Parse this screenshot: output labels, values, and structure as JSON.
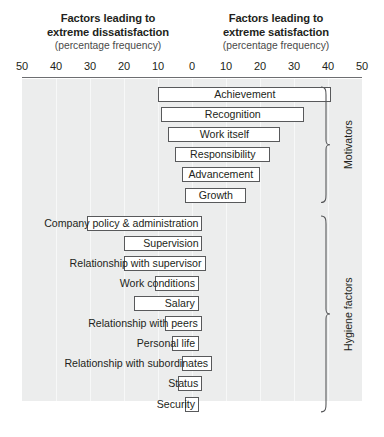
{
  "headings": {
    "left": {
      "line1": "Factors leading to",
      "line2": "extreme dissatisfaction",
      "sub": "(percentage frequency)"
    },
    "right": {
      "line1": "Factors leading to",
      "line2": "extreme satisfaction",
      "sub": "(percentage frequency)"
    }
  },
  "groups": [
    {
      "name": "motivators",
      "label": "Motivators"
    },
    {
      "name": "hygiene",
      "label": "Hygiene factors"
    }
  ],
  "chart_data": {
    "type": "bar",
    "orientation": "horizontal",
    "subtype": "diverging",
    "xlabel": "(percentage frequency)",
    "ylabel": "",
    "xlim": [
      -50,
      50
    ],
    "tick_values": [
      -50,
      -40,
      -30,
      -20,
      -10,
      0,
      10,
      20,
      30,
      40,
      50
    ],
    "tick_labels": [
      "50",
      "40",
      "30",
      "20",
      "10",
      "0",
      "10",
      "20",
      "30",
      "40",
      "50"
    ],
    "grid": true,
    "legend": false,
    "left_axis_meaning": "Factors leading to extreme dissatisfaction (percentage frequency)",
    "right_axis_meaning": "Factors leading to extreme satisfaction (percentage frequency)",
    "categories": [
      "Achievement",
      "Recognition",
      "Work itself",
      "Responsibility",
      "Advancement",
      "Growth",
      "Company policy & administration",
      "Supervision",
      "Relationship with supervisor",
      "Work conditions",
      "Salary",
      "Relationship with peers",
      "Personal life",
      "Relationship with subordinates",
      "Status",
      "Security"
    ],
    "bars": [
      {
        "label": "Achievement",
        "group": "motivators",
        "start": -10,
        "end": 41,
        "label_align": "center"
      },
      {
        "label": "Recognition",
        "group": "motivators",
        "start": -9,
        "end": 33,
        "label_align": "center"
      },
      {
        "label": "Work itself",
        "group": "motivators",
        "start": -7,
        "end": 26,
        "label_align": "center"
      },
      {
        "label": "Responsibility",
        "group": "motivators",
        "start": -5,
        "end": 23,
        "label_align": "center"
      },
      {
        "label": "Advancement",
        "group": "motivators",
        "start": -3,
        "end": 20,
        "label_align": "center"
      },
      {
        "label": "Growth",
        "group": "motivators",
        "start": -2,
        "end": 16,
        "label_align": "center"
      },
      {
        "label": "Company policy & administration",
        "group": "hygiene",
        "start": -31,
        "end": 3,
        "label_align": "right-outside"
      },
      {
        "label": "Supervision",
        "group": "hygiene",
        "start": -20,
        "end": 3,
        "label_align": "right-outside"
      },
      {
        "label": "Relationship with supervisor",
        "group": "hygiene",
        "start": -20,
        "end": 4,
        "label_align": "right-outside"
      },
      {
        "label": "Work conditions",
        "group": "hygiene",
        "start": -11,
        "end": 2,
        "label_align": "right-outside"
      },
      {
        "label": "Salary",
        "group": "hygiene",
        "start": -17,
        "end": 2,
        "label_align": "right-outside"
      },
      {
        "label": "Relationship with peers",
        "group": "hygiene",
        "start": -8,
        "end": 3,
        "label_align": "right-outside"
      },
      {
        "label": "Personal life",
        "group": "hygiene",
        "start": -6,
        "end": 2,
        "label_align": "right-outside"
      },
      {
        "label": "Relationship with subordinates",
        "group": "hygiene",
        "start": -3,
        "end": 6,
        "label_align": "right-outside"
      },
      {
        "label": "Status",
        "group": "hygiene",
        "start": -4,
        "end": 3,
        "label_align": "right-outside"
      },
      {
        "label": "Security",
        "group": "hygiene",
        "start": -2,
        "end": 2,
        "label_align": "right-outside"
      }
    ]
  },
  "colors": {
    "plot_background": "#eceded",
    "gridline": "#f7f8f8",
    "bar_fill": "#ffffff",
    "bar_stroke": "#58595b",
    "text": "#231f20",
    "subtext": "#4a4a4a",
    "axis_rule": "#6d6e71"
  }
}
